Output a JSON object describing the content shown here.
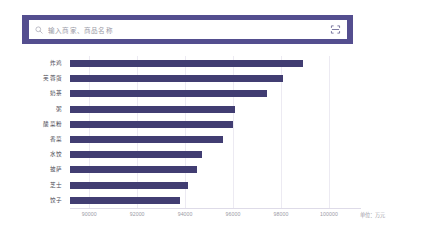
{
  "search": {
    "placeholder": "输入商家、商品名称",
    "value": "",
    "search_icon": "search-icon",
    "scan_icon": "scan-code-icon",
    "band_color": "#544e8f"
  },
  "chart_data": {
    "type": "bar",
    "orientation": "horizontal",
    "title": "",
    "xlabel": "",
    "ylabel": "",
    "unit_label": "单位：万元",
    "grid": true,
    "legend": null,
    "bar_color": "#413d72",
    "xlim": [
      89200,
      101000
    ],
    "xticks": [
      90000,
      92000,
      94000,
      96000,
      98000,
      100000
    ],
    "xtick_labels": [
      "90000",
      "92000",
      "94000",
      "96000",
      "98000",
      "100000"
    ],
    "categories": [
      "炸鸡",
      "芙蓉蛋",
      "奶茶",
      "粥",
      "酸菜粉",
      "香菜",
      "水饺",
      "披萨",
      "芝士",
      "饺子"
    ],
    "values": [
      98900,
      98100,
      97400,
      96100,
      96000,
      95600,
      94700,
      94500,
      94100,
      93800
    ],
    "series": [
      {
        "name": "销售额",
        "values": [
          98900,
          98100,
          97400,
          96100,
          96000,
          95600,
          94700,
          94500,
          94100,
          93800
        ]
      }
    ]
  }
}
